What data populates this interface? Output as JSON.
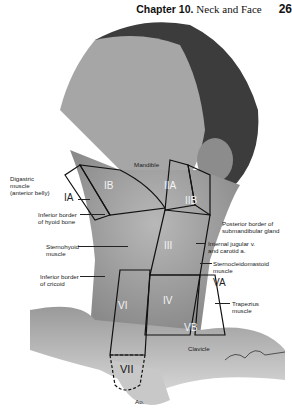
{
  "header": {
    "chapter": "Chapter 10.",
    "title": "Neck and Face",
    "page": "26"
  },
  "figure": {
    "left_labels": [
      {
        "id": "digastric",
        "text": "Digastric\nmuscle\n(anterior belly)"
      },
      {
        "id": "ia",
        "text": "IA"
      },
      {
        "id": "hyoid",
        "text": "Inferior border\nof hyoid bone"
      },
      {
        "id": "sternohyoid",
        "text": "Sternohyoid\nmuscle"
      },
      {
        "id": "cricoid",
        "text": "Inferior border\nof cricoid"
      }
    ],
    "right_labels": [
      {
        "id": "mandible",
        "text": "Mandible"
      },
      {
        "id": "submandibular",
        "text": "Posterior border of\nsubmandibular gland"
      },
      {
        "id": "jugular",
        "text": "Internal jugular v.\nand carotid a."
      },
      {
        "id": "scm",
        "text": "Sternocleidomastoid\nmuscle"
      },
      {
        "id": "va",
        "text": "VA"
      },
      {
        "id": "trapezius",
        "text": "Trapezius\nmuscle"
      },
      {
        "id": "clavicle",
        "text": "Clavicle"
      },
      {
        "id": "ao",
        "text": "Ao."
      }
    ],
    "zones": [
      "IB",
      "IIA",
      "IIB",
      "III",
      "IV",
      "VB",
      "VI",
      "VII"
    ],
    "signature": "artist signature"
  }
}
